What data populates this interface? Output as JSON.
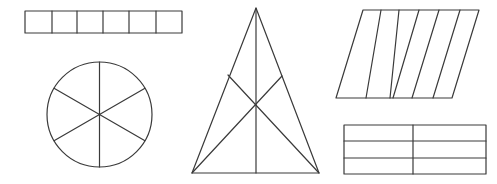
{
  "diagram": {
    "stroke_color": "#3a3a3a",
    "background": "#ffffff",
    "shapes": [
      {
        "name": "rectangle-six-columns",
        "type": "rectangle",
        "x": 25,
        "y": 11,
        "width": 157,
        "height": 22,
        "dividers_x": [
          52,
          77,
          103,
          129,
          156
        ],
        "parts": 6
      },
      {
        "name": "circle-six-sectors",
        "type": "circle",
        "cx": 99.5,
        "cy": 114.5,
        "r": 52.5,
        "spoke_angles_deg": [
          90,
          150,
          210,
          270,
          330,
          30
        ],
        "parts": 6
      },
      {
        "name": "triangle-six-parts",
        "type": "triangle",
        "apex": [
          256,
          8
        ],
        "bottom_left": [
          192,
          173
        ],
        "bottom_right": [
          319,
          173
        ],
        "centroid": [
          256,
          103
        ],
        "left_mid": [
          228,
          75
        ],
        "right_mid": [
          282,
          76
        ],
        "base_mid": [
          256,
          173
        ],
        "parts": 6
      },
      {
        "name": "parallelogram-six-strips",
        "type": "parallelogram",
        "top_y": 10,
        "bottom_y": 98,
        "top_x": [
          363,
          381,
          399,
          419,
          439,
          460,
          479
        ],
        "bottom_x": [
          336,
          366,
          390,
          393,
          412,
          433,
          452
        ],
        "parts": 6
      },
      {
        "name": "rectangle-six-grid",
        "type": "rectangle-grid",
        "x": 344,
        "y": 125,
        "width": 142,
        "height": 49,
        "divider_x": [
          413
        ],
        "divider_y": [
          141,
          158
        ],
        "parts": 6
      }
    ]
  }
}
